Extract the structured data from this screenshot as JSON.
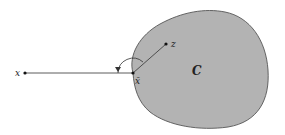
{
  "diagram": {
    "type": "projection-onto-convex-set",
    "set_label": "C",
    "points": {
      "x": {
        "label": "x",
        "pos": [
          25,
          73
        ]
      },
      "x_bar": {
        "label": "x̄",
        "pos": [
          133,
          73
        ]
      },
      "z": {
        "label": "z",
        "pos": [
          166,
          44
        ]
      }
    },
    "colors": {
      "set_fill": "#b3b3b3",
      "set_stroke": "#555555",
      "line": "#333333",
      "background": "#ffffff"
    },
    "annotations": {
      "angle_marker": "obtuse angle arc between segment x̄→x and x̄→z"
    }
  }
}
